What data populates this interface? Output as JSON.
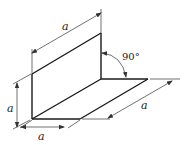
{
  "diagram": {
    "type": "isometric technical drawing",
    "colors": {
      "line": "#1a1a1a",
      "dim_line": "#333333",
      "background": "#ffffff"
    },
    "labels": {
      "top_length": "a",
      "right_length": "a",
      "height": "a",
      "bottom_width": "a",
      "angle": "90°"
    }
  }
}
